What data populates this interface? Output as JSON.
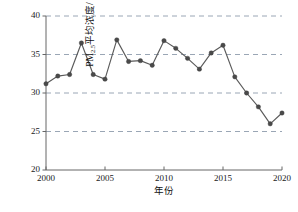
{
  "chart_data": {
    "type": "line",
    "title": "",
    "subtitle": "",
    "xlabel": "年份",
    "ylabel": "PM2.5平均浓度/（μg/m³）",
    "ylabel_parts": {
      "prefix": "PM",
      "subscript": "2.5",
      "middle": "平均浓度/（",
      "unit_base": "μg/m",
      "unit_sup": "3",
      "suffix": "）"
    },
    "xlim": [
      2000,
      2020
    ],
    "ylim": [
      20,
      40
    ],
    "xticks": [
      2000,
      2005,
      2010,
      2015,
      2020
    ],
    "xtick_labels": [
      "2000",
      "2005",
      "2010",
      "2015",
      "2020"
    ],
    "yticks": [
      20,
      25,
      30,
      35,
      40
    ],
    "ytick_labels": [
      "20",
      "25",
      "30",
      "35",
      "40"
    ],
    "grid": "horizontal-dashed",
    "legend": "none",
    "marker": "filled-circle",
    "line_color": "#5a5a5a",
    "marker_color": "#4a4a4a",
    "grid_color": "#9aa6b5",
    "axis_color": "#666666",
    "x": [
      2000,
      2001,
      2002,
      2003,
      2004,
      2005,
      2006,
      2007,
      2008,
      2009,
      2010,
      2011,
      2012,
      2013,
      2014,
      2015,
      2016,
      2017,
      2018,
      2019,
      2020
    ],
    "values": [
      31.2,
      32.2,
      32.4,
      36.5,
      32.4,
      31.8,
      36.9,
      34.1,
      34.2,
      33.6,
      36.8,
      35.8,
      34.5,
      33.1,
      35.2,
      36.2,
      32.1,
      30.0,
      28.2,
      26.0,
      27.4
    ],
    "series": [
      {
        "name": "PM2.5平均浓度",
        "values": [
          31.2,
          32.2,
          32.4,
          36.5,
          32.4,
          31.8,
          36.9,
          34.1,
          34.2,
          33.6,
          36.8,
          35.8,
          34.5,
          33.1,
          35.2,
          36.2,
          32.1,
          30.0,
          28.2,
          26.0,
          27.4
        ]
      }
    ]
  }
}
